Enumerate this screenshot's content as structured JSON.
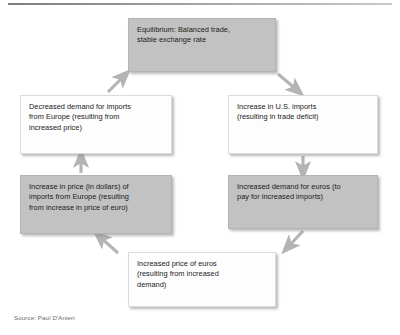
{
  "figure": {
    "source": "Source: Paul D'Anieri",
    "colors": {
      "box_gray": "#c2c2c2",
      "box_white": "#fdfdfd",
      "text": "#1a1a1a",
      "arrow": "#b0b0b0",
      "caption": "#6b6b6b",
      "rule": "#8c8c8c"
    }
  },
  "nodes": {
    "equilibrium": {
      "text": "Equilibrium: Balanced trade,\nstable exchange rate",
      "fill": "gray"
    },
    "us_imports": {
      "text": "Increase in U.S. imports\n(resulting in trade deficit)",
      "fill": "white"
    },
    "decreased_demand": {
      "text": "Decreased demand for imports\nfrom Europe (resulting from\nincreased price)",
      "fill": "white"
    },
    "euro_demand": {
      "text": "Increased demand for euros (to\npay for increased imports)",
      "fill": "gray"
    },
    "import_price": {
      "text": "Increase in price (in dollars) of\nimports from Europe (resulting\nfrom increase in price of euro)",
      "fill": "gray"
    },
    "euro_price": {
      "text": "Increased price of euros\n(resulting from increased\ndemand)",
      "fill": "white"
    }
  },
  "arrows": [
    {
      "name": "equilibrium-to-us-imports",
      "from": "equilibrium",
      "to": "us_imports",
      "direction": "down-right"
    },
    {
      "name": "us-imports-to-euro-demand",
      "from": "us_imports",
      "to": "euro_demand",
      "direction": "down"
    },
    {
      "name": "euro-demand-to-euro-price",
      "from": "euro_demand",
      "to": "euro_price",
      "direction": "down-left"
    },
    {
      "name": "euro-price-to-import-price",
      "from": "euro_price",
      "to": "import_price",
      "direction": "up-left"
    },
    {
      "name": "import-price-to-decreased-demand",
      "from": "import_price",
      "to": "decreased_demand",
      "direction": "up"
    },
    {
      "name": "decreased-demand-to-equilibrium",
      "from": "decreased_demand",
      "to": "equilibrium",
      "direction": "up-right"
    }
  ]
}
